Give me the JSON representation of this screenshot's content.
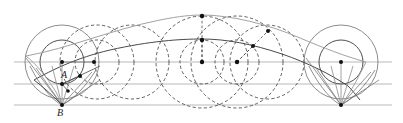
{
  "figure": {
    "type": "geometric-construction",
    "width": 403,
    "height": 123,
    "background": "#ffffff",
    "labels": [
      {
        "name": "point-label-A",
        "text": "A",
        "x": 61,
        "y": 70
      },
      {
        "name": "point-label-B",
        "text": "B",
        "x": 57,
        "y": 108
      }
    ],
    "colors": {
      "solid_stroke": "#3a3a3a",
      "dashed_stroke": "#2b2b2b",
      "light_stroke": "#8a8a8a",
      "gray_curve": "#9a9a9a",
      "dark_curve": "#4a4a4a",
      "dot_fill": "#111111",
      "baseline": "#9b9b9b"
    },
    "geometry": {
      "baseline_y": 105,
      "midline_y": 84,
      "axis_y": 62,
      "big_radius": 37,
      "small_radius": 22,
      "left_center": {
        "x": 62,
        "y": 62
      },
      "right_center": {
        "x": 341,
        "y": 62
      },
      "left_cusp": {
        "x": 62,
        "y": 105
      },
      "right_cusp": {
        "x": 341,
        "y": 105
      }
    },
    "solid_circles": [
      {
        "name": "left-outer-circle",
        "cx": 62,
        "cy": 62,
        "r": 37
      },
      {
        "name": "left-inner-circle",
        "cx": 62,
        "cy": 62,
        "r": 22
      },
      {
        "name": "right-outer-circle",
        "cx": 341,
        "cy": 62,
        "r": 37
      },
      {
        "name": "right-inner-circle",
        "cx": 341,
        "cy": 62,
        "r": 22
      }
    ],
    "dashed_circles": [
      {
        "name": "dashed-circle-1",
        "cx": 97,
        "cy": 62,
        "r": 37
      },
      {
        "name": "dashed-circle-2",
        "cx": 97,
        "cy": 62,
        "r": 22
      },
      {
        "name": "dashed-circle-3",
        "cx": 132,
        "cy": 62,
        "r": 37
      },
      {
        "name": "dashed-circle-4",
        "cx": 202,
        "cy": 62,
        "r": 46
      },
      {
        "name": "dashed-circle-5",
        "cx": 202,
        "cy": 62,
        "r": 22
      },
      {
        "name": "dashed-circle-6",
        "cx": 237,
        "cy": 62,
        "r": 46
      },
      {
        "name": "dashed-circle-7",
        "cx": 237,
        "cy": 62,
        "r": 22
      },
      {
        "name": "dashed-circle-8",
        "cx": 267,
        "cy": 62,
        "r": 37
      }
    ],
    "dots": [
      {
        "name": "dot-left-center",
        "x": 62,
        "y": 62
      },
      {
        "name": "dot-axis-94",
        "x": 94,
        "y": 62
      },
      {
        "name": "dot-axis-202",
        "x": 202,
        "y": 62
      },
      {
        "name": "dot-axis-237",
        "x": 237,
        "y": 62
      },
      {
        "name": "dot-apex-top",
        "x": 202,
        "y": 16
      },
      {
        "name": "dot-curve-mid",
        "x": 202,
        "y": 40
      },
      {
        "name": "dot-curve-right-upper",
        "x": 268,
        "y": 31
      },
      {
        "name": "dot-curve-right-lower",
        "x": 253,
        "y": 46
      },
      {
        "name": "dot-point-a",
        "x": 80,
        "y": 76
      },
      {
        "name": "dot-point-a2",
        "x": 62,
        "y": 84
      },
      {
        "name": "dot-below-a",
        "x": 68,
        "y": 91
      },
      {
        "name": "dot-left-cusp",
        "x": 62,
        "y": 105
      },
      {
        "name": "dot-right-center",
        "x": 341,
        "y": 62
      },
      {
        "name": "dot-right-cusp",
        "x": 341,
        "y": 105
      }
    ],
    "horizontal_lines": [
      {
        "name": "axis-line",
        "y": 62,
        "x1": 14,
        "x2": 392
      },
      {
        "name": "mid-line",
        "y": 84,
        "x1": 14,
        "x2": 392
      },
      {
        "name": "base-line",
        "y": 105,
        "x1": 14,
        "x2": 392
      }
    ],
    "arc_curves": [
      {
        "name": "outer-gray-arc",
        "description": "large shallow arc from left cusp region to right cusp region, apex near x=202 y=16"
      },
      {
        "name": "inner-dark-arc",
        "description": "inner trochoid arc, apex near x=202 y=40"
      },
      {
        "name": "left-tangent-lines",
        "description": "rays converging at left cusp B"
      },
      {
        "name": "right-tangent-lines",
        "description": "rays converging at right cusp"
      }
    ]
  }
}
